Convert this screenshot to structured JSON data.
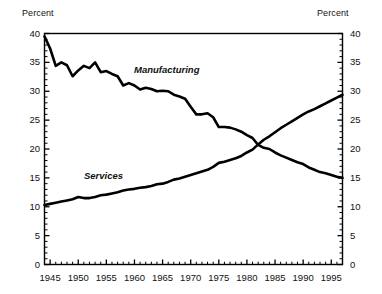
{
  "chart_data": {
    "type": "line",
    "title": "",
    "xlabel": "",
    "ylabel": "Percent",
    "y_axis_title_left": "Percent",
    "y_axis_title_right": "Percent",
    "ylim": [
      0,
      40
    ],
    "xlim": [
      1944,
      1997
    ],
    "y_ticks": [
      0,
      5,
      10,
      15,
      20,
      25,
      30,
      35,
      40
    ],
    "y_tick_labels": [
      "0",
      "5",
      "10",
      "15",
      "20",
      "25",
      "30",
      "35",
      "40"
    ],
    "y_minor_tick_step": 1,
    "x_ticks": [
      1945,
      1950,
      1955,
      1960,
      1965,
      1970,
      1975,
      1980,
      1985,
      1990,
      1995
    ],
    "x_tick_labels": [
      "1945",
      "1950",
      "1955",
      "1960",
      "1965",
      "1970",
      "1975",
      "1980",
      "1985",
      "1990",
      "1995"
    ],
    "x_minor_tick_step": 1,
    "grid": false,
    "legend_position": "inline-annotation",
    "line_color": "#000000",
    "line_width_px": 2.6,
    "annotations": [
      {
        "text": "Manufacturing",
        "series": "Manufacturing",
        "x": 1960,
        "y": 32.4,
        "style": "italic"
      },
      {
        "text": "Services",
        "series": "Services",
        "x": 1952,
        "y": 16.8,
        "style": "italic"
      }
    ],
    "series": [
      {
        "name": "Manufacturing",
        "x": [
          1944,
          1945,
          1946,
          1947,
          1948,
          1949,
          1950,
          1951,
          1952,
          1953,
          1954,
          1955,
          1956,
          1957,
          1958,
          1959,
          1960,
          1961,
          1962,
          1963,
          1964,
          1965,
          1966,
          1967,
          1968,
          1969,
          1970,
          1971,
          1972,
          1973,
          1974,
          1975,
          1976,
          1977,
          1978,
          1979,
          1980,
          1981,
          1982,
          1983,
          1984,
          1985,
          1986,
          1987,
          1988,
          1989,
          1990,
          1991,
          1992,
          1993,
          1994,
          1995,
          1996,
          1997
        ],
        "values": [
          39.5,
          37.4,
          34.4,
          35.0,
          34.5,
          32.6,
          33.6,
          34.4,
          34.0,
          35.0,
          33.3,
          33.5,
          33.0,
          32.6,
          31.0,
          31.4,
          31.0,
          30.3,
          30.6,
          30.4,
          30.0,
          30.1,
          30.0,
          29.4,
          29.1,
          28.7,
          27.3,
          26.0,
          26.0,
          26.2,
          25.5,
          23.8,
          23.8,
          23.7,
          23.4,
          23.0,
          22.4,
          21.9,
          20.7,
          20.2,
          20.0,
          19.4,
          18.9,
          18.5,
          18.1,
          17.7,
          17.4,
          16.8,
          16.4,
          16.0,
          15.8,
          15.5,
          15.2,
          15.0
        ]
      },
      {
        "name": "Services",
        "x": [
          1944,
          1945,
          1946,
          1947,
          1948,
          1949,
          1950,
          1951,
          1952,
          1953,
          1954,
          1955,
          1956,
          1957,
          1958,
          1959,
          1960,
          1961,
          1962,
          1963,
          1964,
          1965,
          1966,
          1967,
          1968,
          1969,
          1970,
          1971,
          1972,
          1973,
          1974,
          1975,
          1976,
          1977,
          1978,
          1979,
          1980,
          1981,
          1982,
          1983,
          1984,
          1985,
          1986,
          1987,
          1988,
          1989,
          1990,
          1991,
          1992,
          1993,
          1994,
          1995,
          1996,
          1997
        ],
        "values": [
          10.3,
          10.5,
          10.7,
          10.9,
          11.1,
          11.3,
          11.7,
          11.5,
          11.5,
          11.7,
          12.0,
          12.1,
          12.3,
          12.5,
          12.8,
          13.0,
          13.1,
          13.3,
          13.4,
          13.6,
          13.9,
          14.0,
          14.3,
          14.7,
          14.9,
          15.2,
          15.5,
          15.8,
          16.1,
          16.4,
          16.9,
          17.6,
          17.8,
          18.1,
          18.4,
          18.8,
          19.4,
          19.9,
          20.8,
          21.6,
          22.2,
          22.9,
          23.6,
          24.2,
          24.8,
          25.4,
          26.0,
          26.5,
          26.9,
          27.4,
          27.9,
          28.4,
          28.9,
          29.4
        ]
      }
    ]
  }
}
